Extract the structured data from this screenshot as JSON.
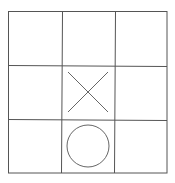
{
  "game": {
    "name": "Tic-Tac-Toe",
    "rows": 3,
    "cols": 3,
    "line_color": "#555555",
    "mark_color": "#666666",
    "cells": [
      [
        "",
        "",
        ""
      ],
      [
        "",
        "X",
        ""
      ],
      [
        "",
        "O",
        ""
      ]
    ]
  }
}
